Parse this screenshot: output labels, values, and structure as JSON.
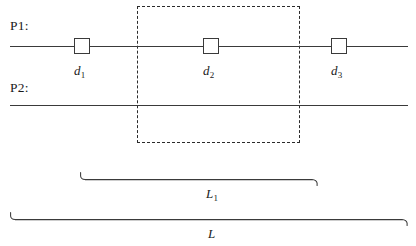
{
  "figure": {
    "background_color": "#ffffff",
    "stroke_color": "#3a3a3a",
    "dash_color": "#2b2b2b",
    "text_color": "#1a1a1a"
  },
  "paths": [
    {
      "name": "p1",
      "label": "P1:"
    },
    {
      "name": "p2",
      "label": "P2:"
    }
  ],
  "nodes": [
    {
      "name": "node-1",
      "distance_label": "d",
      "distance_sub": "1"
    },
    {
      "name": "node-2",
      "distance_label": "d",
      "distance_sub": "2"
    },
    {
      "name": "node-3",
      "distance_label": "d",
      "distance_sub": "3"
    }
  ],
  "braces": [
    {
      "name": "brace-l1",
      "label": "L",
      "sub": "1"
    },
    {
      "name": "brace-l",
      "label": "L",
      "sub": ""
    }
  ],
  "region": {
    "name": "dashed-region",
    "style": "dashed"
  }
}
